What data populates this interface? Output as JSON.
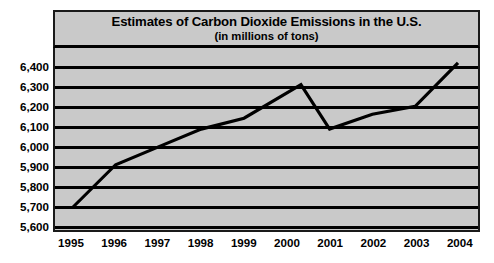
{
  "chart_data": {
    "type": "line",
    "title": "Estimates of Carbon Dioxide Emissions in the U.S.",
    "subtitle": "(in millions of tons)",
    "xlabel": "",
    "ylabel": "",
    "categories": [
      "1995",
      "1996",
      "1997",
      "1998",
      "1999",
      "2000",
      "2001",
      "2002",
      "2003",
      "2004"
    ],
    "values": [
      5690,
      5905,
      5995,
      6085,
      6140,
      6310,
      6085,
      6160,
      6200,
      6420
    ],
    "ylim": [
      5600,
      6450
    ],
    "ytick_labels": [
      "6,400",
      "6,300",
      "6,200",
      "6,100",
      "6,000",
      "5,900",
      "5,800",
      "5,700",
      "5,600"
    ],
    "ytick_values": [
      6400,
      6300,
      6200,
      6100,
      6000,
      5900,
      5800,
      5700,
      5600
    ],
    "grid": true,
    "legend": "none",
    "series_color": "#000000",
    "plot_background": "#c9c9c9",
    "frame_color": "#1a1a1a"
  }
}
